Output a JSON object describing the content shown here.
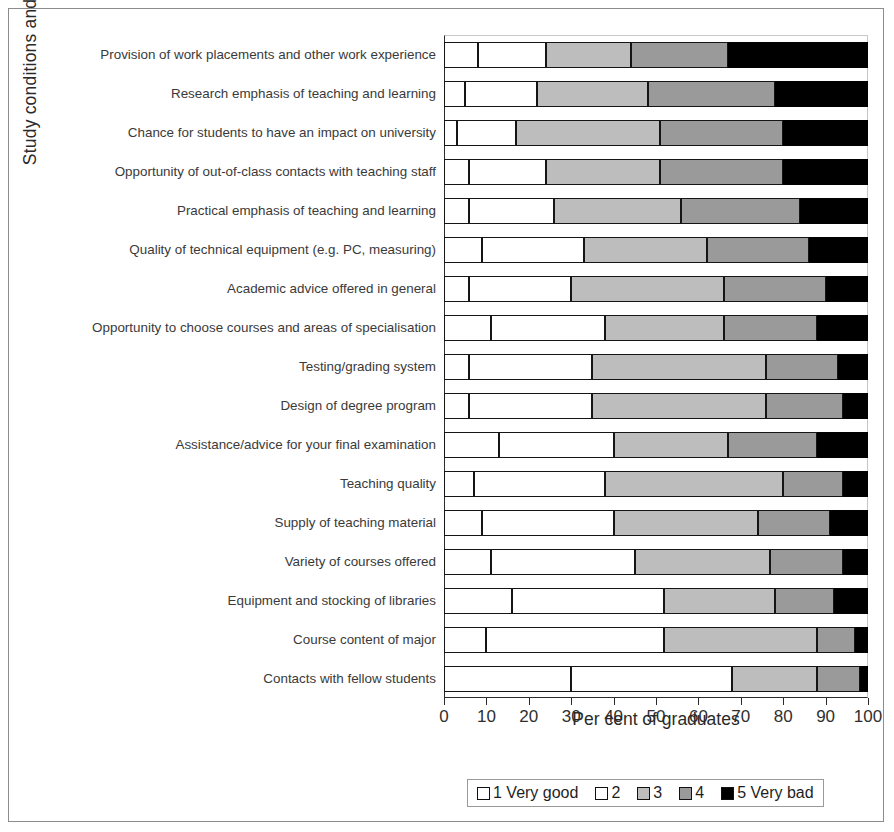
{
  "chart_data": {
    "type": "bar",
    "orientation": "horizontal",
    "stacked": true,
    "stack_mode": "percent",
    "title": "",
    "xlabel": "Per cent of graduates",
    "ylabel": "Study conditions and provisions",
    "xlim": [
      0,
      100
    ],
    "xticks": [
      0,
      10,
      20,
      30,
      40,
      50,
      60,
      70,
      80,
      90,
      100
    ],
    "xtick_labels": [
      "0",
      "10",
      "20",
      "30",
      "40",
      "50",
      "60",
      "70",
      "80",
      "90",
      "100"
    ],
    "grid": false,
    "legend_position": "bottom",
    "legend": [
      "1 Very good",
      "2",
      "3",
      "4",
      "5 Very bad"
    ],
    "series": [
      {
        "name": "1 Very good",
        "color": "#ffffff",
        "values": [
          8,
          5,
          3,
          6,
          6,
          9,
          6,
          11,
          6,
          6,
          13,
          7,
          9,
          11,
          16,
          10,
          30
        ]
      },
      {
        "name": "2",
        "color": "#ffffff",
        "values": [
          16,
          17,
          14,
          18,
          20,
          24,
          24,
          27,
          29,
          29,
          27,
          31,
          31,
          34,
          36,
          42,
          38
        ]
      },
      {
        "name": "3",
        "color": "#bdbdbd",
        "values": [
          20,
          26,
          34,
          27,
          30,
          29,
          36,
          28,
          41,
          41,
          27,
          42,
          34,
          32,
          26,
          36,
          20
        ]
      },
      {
        "name": "4",
        "color": "#9a9a9a",
        "values": [
          23,
          30,
          29,
          29,
          28,
          24,
          24,
          22,
          17,
          18,
          21,
          14,
          17,
          17,
          14,
          9,
          10
        ]
      },
      {
        "name": "5 Very bad",
        "color": "#000000",
        "values": [
          33,
          22,
          20,
          20,
          16,
          14,
          10,
          12,
          7,
          6,
          12,
          6,
          9,
          6,
          8,
          3,
          2
        ]
      }
    ],
    "categories": [
      "Provision of work placements and other work experience",
      "Research emphasis of teaching and learning",
      "Chance for students to have an impact on university",
      "Opportunity of out-of-class contacts with teaching staff",
      "Practical emphasis of teaching and learning",
      "Quality of technical equipment (e.g. PC, measuring)",
      "Academic advice offered in general",
      "Opportunity to choose courses and areas of specialisation",
      "Testing/grading system",
      "Design of degree program",
      "Assistance/advice for your final examination",
      "Teaching quality",
      "Supply of teaching material",
      "Variety of courses offered",
      "Equipment and stocking of libraries",
      "Course content of major",
      "Contacts with fellow students"
    ]
  },
  "colors": {
    "cat1": "#ffffff",
    "cat2": "#ffffff",
    "cat3": "#bdbdbd",
    "cat4": "#9a9a9a",
    "cat5": "#000000",
    "outline": "#151515",
    "axis": "#2b2b2b",
    "frame": "#8c8c8c"
  }
}
